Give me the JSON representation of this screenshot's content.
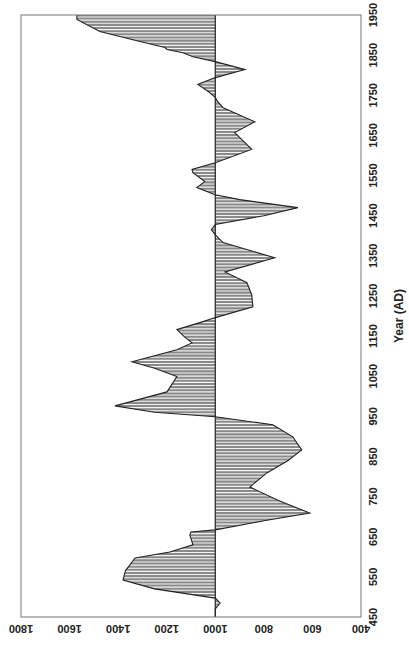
{
  "chart_data": {
    "type": "area",
    "orientation": "rotated 90 degrees counter-clockwise",
    "title": "",
    "xlabel": "Year (AD)",
    "ylabel": "Ring thickness (microns)",
    "xlim": [
      450,
      1950
    ],
    "ylim": [
      400,
      1800
    ],
    "baseline": 1000,
    "x_ticks": [
      450,
      550,
      650,
      750,
      850,
      950,
      1050,
      1150,
      1250,
      1350,
      1450,
      1550,
      1650,
      1750,
      1850,
      1950
    ],
    "y_ticks": [
      400,
      600,
      800,
      1000,
      1200,
      1400,
      1600,
      1800
    ],
    "grid": false,
    "legend": null,
    "fill_color": "#8a8a8a",
    "stripe_color": "#f2f2f2",
    "outline_color": "#222222",
    "series": [
      {
        "name": "Ring thickness",
        "x": [
          450,
          470,
          485,
          497,
          520,
          542,
          565,
          597,
          612,
          630,
          645,
          654,
          662,
          667,
          690,
          709,
          740,
          774,
          809,
          840,
          866,
          899,
          929,
          949,
          960,
          976,
          1011,
          1049,
          1070,
          1086,
          1116,
          1133,
          1150,
          1166,
          1186,
          1196,
          1223,
          1253,
          1283,
          1310,
          1345,
          1383,
          1402,
          1415,
          1428,
          1450,
          1470,
          1490,
          1502,
          1520,
          1535,
          1557,
          1565,
          1582,
          1615,
          1657,
          1684,
          1719,
          1734,
          1745,
          1760,
          1777,
          1794,
          1814,
          1834,
          1846,
          1856,
          1864,
          1869,
          1884,
          1909,
          1939,
          1950
        ],
        "y": [
          1000,
          1000,
          980,
          1000,
          1250,
          1380,
          1370,
          1330,
          1187,
          1092,
          1100,
          1105,
          1100,
          1000,
          800,
          611,
          740,
          858,
          788,
          700,
          644,
          681,
          763,
          1000,
          1250,
          1413,
          1199,
          1158,
          1250,
          1343,
          1158,
          1096,
          1130,
          1158,
          1050,
          1000,
          845,
          850,
          870,
          960,
          755,
          968,
          1000,
          1016,
          1000,
          800,
          660,
          900,
          1000,
          1076,
          1043,
          1092,
          1096,
          1000,
          850,
          920,
          837,
          968,
          990,
          1000,
          1030,
          1072,
          1000,
          878,
          1000,
          1092,
          1133,
          1199,
          1207,
          1310,
          1475,
          1570,
          1570
        ]
      }
    ]
  },
  "axes": {
    "xlabel": "Year (AD)",
    "ylabel": "Ring thickness (microns)"
  }
}
